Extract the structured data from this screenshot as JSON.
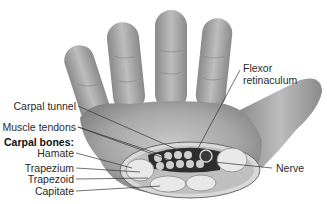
{
  "diagram": {
    "labels": {
      "carpal_tunnel": "Carpal tunnel",
      "muscle_tendons": "Muscle tendons",
      "carpal_bones_heading": "Carpal bones:",
      "hamate": "Hamate",
      "trapezium": "Trapezium",
      "trapezoid": "Trapezoid",
      "capitate": "Capitate",
      "flexor_line1": "Flexor",
      "flexor_line2": "retinaculum",
      "nerve": "Nerve"
    },
    "colors": {
      "skin": "#9a9a9a",
      "skin_light": "#c4c4c4",
      "bone": "#e6e6e6",
      "tunnel": "#2e2e2e",
      "leader": "#333333"
    }
  }
}
